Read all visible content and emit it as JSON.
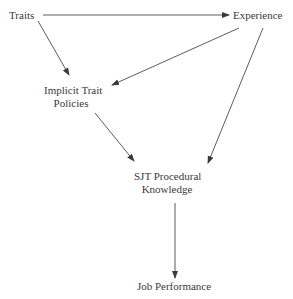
{
  "diagram": {
    "nodes": {
      "traits": {
        "label": "Traits"
      },
      "experience": {
        "label": "Experience"
      },
      "implicit": {
        "line1": "Implicit Trait",
        "line2": "Policies"
      },
      "sjt": {
        "line1": "SJT Procedural",
        "line2": "Knowledge"
      },
      "job": {
        "label": "Job Performance"
      }
    },
    "edges": [
      {
        "from": "Traits",
        "to": "Experience"
      },
      {
        "from": "Traits",
        "to": "Implicit Trait Policies"
      },
      {
        "from": "Experience",
        "to": "Implicit Trait Policies"
      },
      {
        "from": "Implicit Trait Policies",
        "to": "SJT Procedural Knowledge"
      },
      {
        "from": "Experience",
        "to": "SJT Procedural Knowledge"
      },
      {
        "from": "SJT Procedural Knowledge",
        "to": "Job Performance"
      }
    ],
    "colors": {
      "line": "#4a4a4a",
      "text": "#3a3a3a"
    }
  }
}
